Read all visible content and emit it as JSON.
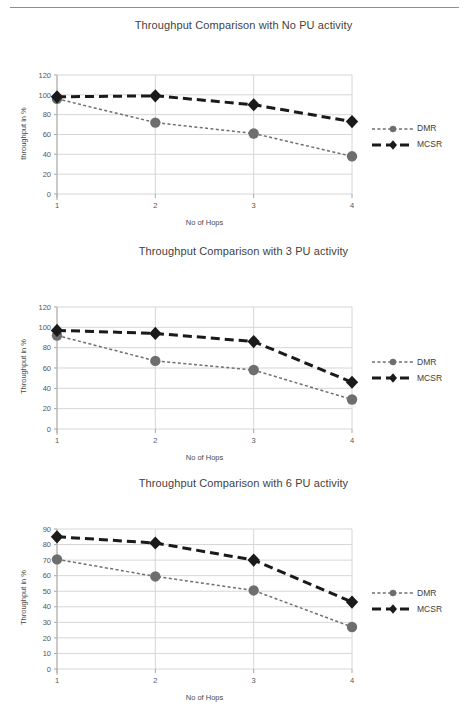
{
  "page": {
    "background": "#ffffff",
    "rule_color": "#8e8e8e"
  },
  "series_style": {
    "dmr_color": "#6e6e6e",
    "mcsr_color": "#1a1a1a"
  },
  "charts": [
    {
      "id": "chart-1",
      "title": "Throughput Comparison with No PU activity",
      "ylabel": "throughput in %",
      "xlabel": "No of Hops",
      "legend": [
        "DMR",
        "MCSR"
      ],
      "chart_data": {
        "type": "line",
        "title": "Throughput Comparison with No PU activity",
        "xlabel": "No of Hops",
        "ylabel": "throughput in %",
        "categories": [
          "1",
          "2",
          "3",
          "4"
        ],
        "x": [
          1,
          2,
          3,
          4
        ],
        "xlim": [
          1,
          4
        ],
        "ylim": [
          0,
          120
        ],
        "yticks": [
          0,
          20,
          40,
          60,
          80,
          100,
          120
        ],
        "grid": true,
        "legend_position": "right",
        "series": [
          {
            "name": "DMR",
            "values": [
              96,
              72,
              61,
              38
            ],
            "marker": "circle",
            "line": "dotted",
            "color": "#6e6e6e"
          },
          {
            "name": "MCSR",
            "values": [
              98,
              99,
              90,
              73
            ],
            "marker": "diamond",
            "line": "dashed",
            "color": "#1a1a1a"
          }
        ]
      }
    },
    {
      "id": "chart-2",
      "title": "Throughput Comparison with 3 PU activity",
      "ylabel": "Throughput in %",
      "xlabel": "No of Hops",
      "legend": [
        "DMR",
        "MCSR"
      ],
      "chart_data": {
        "type": "line",
        "title": "Throughput Comparison with 3 PU activity",
        "xlabel": "No of Hops",
        "ylabel": "Throughput in %",
        "categories": [
          "1",
          "2",
          "3",
          "4"
        ],
        "x": [
          1,
          2,
          3,
          4
        ],
        "xlim": [
          1,
          4
        ],
        "ylim": [
          0,
          120
        ],
        "yticks": [
          0,
          20,
          40,
          60,
          80,
          100,
          120
        ],
        "grid": true,
        "legend_position": "right",
        "series": [
          {
            "name": "DMR",
            "values": [
              92,
              67,
              58,
              29
            ],
            "marker": "circle",
            "line": "dotted",
            "color": "#6e6e6e"
          },
          {
            "name": "MCSR",
            "values": [
              97,
              94,
              86,
              46
            ],
            "marker": "diamond",
            "line": "dashed",
            "color": "#1a1a1a"
          }
        ]
      }
    },
    {
      "id": "chart-3",
      "title": "Throughput Comparison with 6 PU activity",
      "ylabel": "Throughput in %",
      "xlabel": "No of Hops",
      "legend": [
        "DMR",
        "MCSR"
      ],
      "chart_data": {
        "type": "line",
        "title": "Throughput Comparison with 6 PU activity",
        "xlabel": "No of Hops",
        "ylabel": "Throughput in %",
        "categories": [
          "1",
          "2",
          "3",
          "4"
        ],
        "x": [
          1,
          2,
          3,
          4
        ],
        "xlim": [
          1,
          4
        ],
        "ylim": [
          0,
          90
        ],
        "yticks": [
          0,
          10,
          20,
          30,
          40,
          50,
          60,
          70,
          80,
          90
        ],
        "grid": true,
        "legend_position": "right",
        "series": [
          {
            "name": "DMR",
            "values": [
              70.5,
              59.5,
              50.5,
              27
            ],
            "marker": "circle",
            "line": "dotted",
            "color": "#6e6e6e"
          },
          {
            "name": "MCSR",
            "values": [
              85,
              81,
              70,
              43
            ],
            "marker": "diamond",
            "line": "dashed",
            "color": "#1a1a1a"
          }
        ]
      }
    }
  ]
}
